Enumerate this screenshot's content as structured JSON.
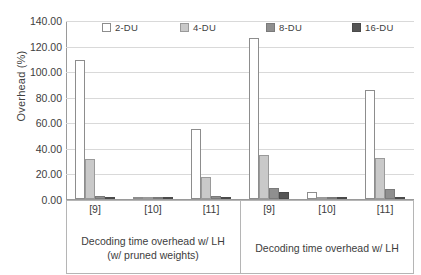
{
  "chart_data": {
    "type": "bar",
    "title": "",
    "xlabel": "",
    "ylabel": "Overhead (%)",
    "ylim": [
      0,
      140
    ],
    "ytick_step": 20,
    "ytick_labels": [
      "0.00",
      "20.00",
      "40.00",
      "60.00",
      "80.00",
      "100.00",
      "120.00",
      "140.00"
    ],
    "ytick_values": [
      0,
      20,
      40,
      60,
      80,
      100,
      120,
      140
    ],
    "grid": true,
    "legend_position": "top",
    "legend": [
      "2-DU",
      "4-DU",
      "8-DU",
      "16-DU"
    ],
    "series": [
      {
        "name": "2-DU",
        "color": "#ffffff",
        "values": [
          108.5,
          0.8,
          54.5,
          126.0,
          5.6,
          85.5
        ]
      },
      {
        "name": "4-DU",
        "color": "#c9c9c9",
        "values": [
          31.2,
          0.6,
          17.3,
          34.4,
          1.0,
          32.3
        ]
      },
      {
        "name": "8-DU",
        "color": "#8f8f8f",
        "values": [
          2.2,
          0.3,
          2.6,
          8.9,
          0.5,
          7.7
        ]
      },
      {
        "name": "16-DU",
        "color": "#555555",
        "values": [
          0.9,
          0.3,
          0.5,
          5.5,
          0.3,
          1.4
        ]
      }
    ],
    "categories": [
      "[9]",
      "[10]",
      "[11]",
      "[9]",
      "[10]",
      "[11]"
    ],
    "groups": [
      {
        "label_line1": "Decoding time overhead w/ LH",
        "label_line2": "(w/ pruned weights)",
        "categories": [
          "[9]",
          "[10]",
          "[11]"
        ]
      },
      {
        "label_line1": "Decoding time overhead w/ LH",
        "label_line2": "",
        "categories": [
          "[9]",
          "[10]",
          "[11]"
        ]
      }
    ]
  }
}
